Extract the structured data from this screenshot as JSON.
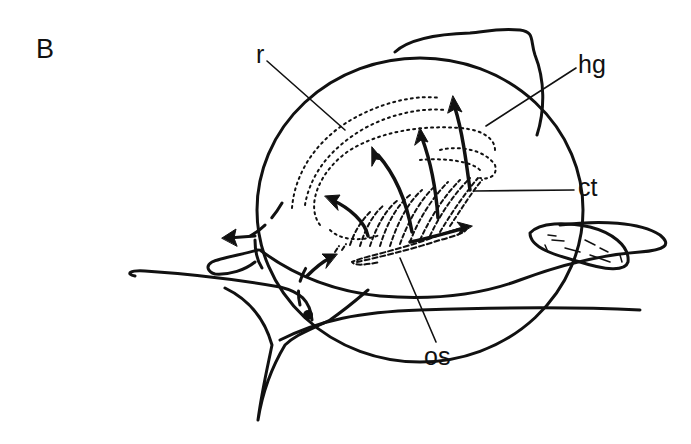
{
  "figure": {
    "panel_letter": "B",
    "labels": {
      "r": "r",
      "hg": "hg",
      "ct": "ct",
      "os": "os"
    },
    "colors": {
      "ink": "#111111",
      "background": "#ffffff"
    }
  }
}
